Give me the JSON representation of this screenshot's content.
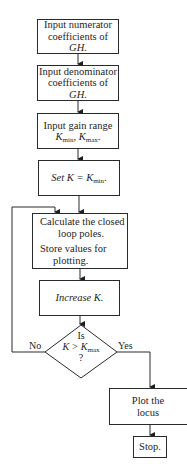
{
  "diagram": {
    "type": "flowchart",
    "nodes": [
      {
        "id": "n1",
        "shape": "rect",
        "lines": [
          "Input numerator",
          "coefficients of",
          "GH."
        ]
      },
      {
        "id": "n2",
        "shape": "rect",
        "lines": [
          "Input denominator",
          "coefficients of",
          "GH."
        ]
      },
      {
        "id": "n3",
        "shape": "rect",
        "lines": [
          "Input gain range",
          "K",
          "min",
          ", K",
          "max",
          "."
        ]
      },
      {
        "id": "n4",
        "shape": "rect",
        "lines": [
          "Set K = K",
          "min",
          "."
        ]
      },
      {
        "id": "n5",
        "shape": "rect",
        "lines": [
          "Calculate the closed",
          "loop poles.",
          "Store values for",
          "plotting."
        ]
      },
      {
        "id": "n6",
        "shape": "rect",
        "lines": [
          "Increase K."
        ]
      },
      {
        "id": "n7",
        "shape": "diamond",
        "lines": [
          "Is",
          "K > K",
          "max",
          "?"
        ]
      },
      {
        "id": "n8",
        "shape": "rect",
        "lines": [
          "Plot the",
          "locus"
        ]
      },
      {
        "id": "n9",
        "shape": "rect",
        "lines": [
          "Stop."
        ]
      }
    ],
    "edges": [
      {
        "from": "n1",
        "to": "n2"
      },
      {
        "from": "n2",
        "to": "n3"
      },
      {
        "from": "n3",
        "to": "n4"
      },
      {
        "from": "n4",
        "to": "n5"
      },
      {
        "from": "n5",
        "to": "n6"
      },
      {
        "from": "n6",
        "to": "n7"
      },
      {
        "from": "n7",
        "to": "n5",
        "label": "No"
      },
      {
        "from": "n7",
        "to": "n8",
        "label": "Yes"
      },
      {
        "from": "n8",
        "to": "n9"
      }
    ],
    "labels": {
      "no": "No",
      "yes": "Yes"
    }
  }
}
